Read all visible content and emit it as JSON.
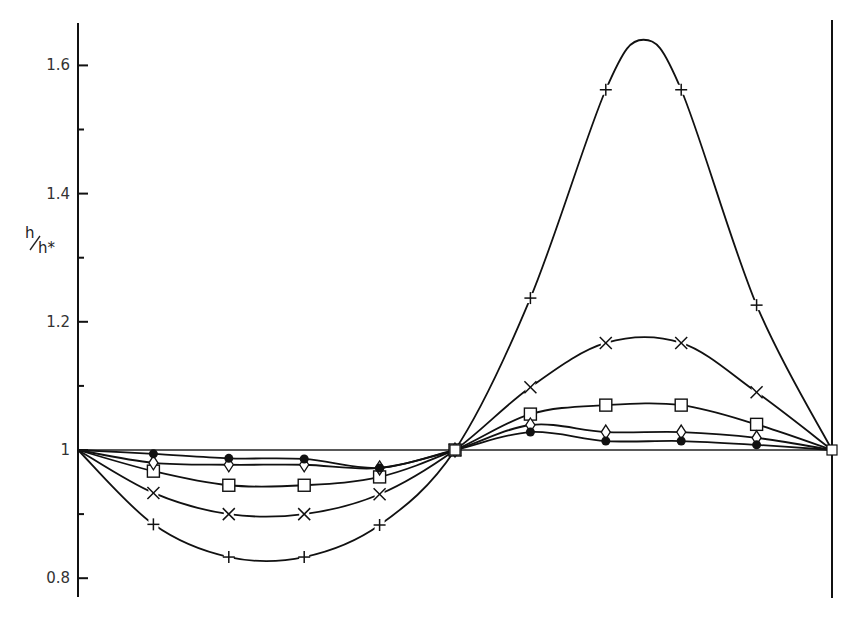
{
  "chart_data": {
    "type": "line",
    "title": "",
    "xlabel": "",
    "ylabel": "h/h*",
    "ylim": [
      0.8,
      1.65
    ],
    "yticks": [
      0.8,
      0.9,
      1.0,
      1.1,
      1.2,
      1.3,
      1.4,
      1.5,
      1.6
    ],
    "ytick_labels": [
      "0.8",
      "",
      "1",
      "",
      "1.2",
      "",
      "1.4",
      "",
      "1.6"
    ],
    "x": [
      0,
      1,
      2,
      3,
      4,
      5,
      6,
      7,
      8,
      9,
      10
    ],
    "grid": false,
    "reference_line": 1.0,
    "series": [
      {
        "name": "plus",
        "marker": "+",
        "values": [
          1.0,
          0.884,
          0.833,
          0.833,
          0.883,
          1.0,
          1.237,
          1.562,
          1.562,
          1.226,
          1.0
        ],
        "peak": 1.64
      },
      {
        "name": "cross",
        "marker": "x",
        "values": [
          1.0,
          0.933,
          0.9,
          0.9,
          0.931,
          1.0,
          1.098,
          1.167,
          1.167,
          1.09,
          1.0
        ]
      },
      {
        "name": "square",
        "marker": "square",
        "values": [
          1.0,
          0.967,
          0.945,
          0.945,
          0.958,
          1.0,
          1.056,
          1.07,
          1.07,
          1.04,
          1.0
        ]
      },
      {
        "name": "diamond",
        "marker": "diamond",
        "values": [
          1.0,
          0.98,
          0.977,
          0.977,
          0.972,
          1.0,
          1.039,
          1.028,
          1.028,
          1.019,
          1.0
        ]
      },
      {
        "name": "dot",
        "marker": "filled-circle",
        "values": [
          1.0,
          0.994,
          0.987,
          0.986,
          0.972,
          1.0,
          1.028,
          1.014,
          1.014,
          1.008,
          1.0
        ]
      }
    ]
  },
  "axis": {
    "ylabel_num": "h",
    "ylabel_den": "h*"
  }
}
